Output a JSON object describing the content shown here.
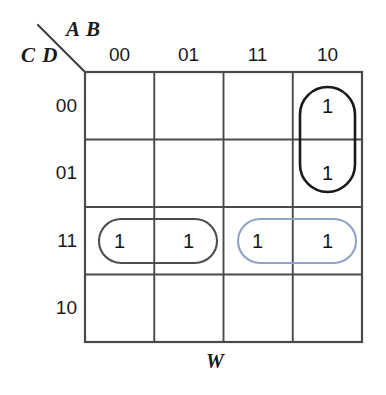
{
  "diagram": {
    "type": "karnaugh-map",
    "title_top": "A B",
    "title_left": "C D",
    "bottom_variable": "W",
    "column_headers": [
      "00",
      "01",
      "11",
      "10"
    ],
    "row_headers": [
      "00",
      "01",
      "11",
      "10"
    ],
    "cells": [
      [
        {
          "value": ""
        },
        {
          "value": ""
        },
        {
          "value": ""
        },
        {
          "value": "1"
        }
      ],
      [
        {
          "value": ""
        },
        {
          "value": ""
        },
        {
          "value": ""
        },
        {
          "value": "1"
        }
      ],
      [
        {
          "value": "1"
        },
        {
          "value": "1"
        },
        {
          "value": "1"
        },
        {
          "value": "1"
        }
      ],
      [
        {
          "value": ""
        },
        {
          "value": ""
        },
        {
          "value": ""
        },
        {
          "value": ""
        }
      ]
    ],
    "groups": [
      {
        "name": "group-vertical-black",
        "color": "#1a1a1a",
        "orientation": "vertical",
        "columns": [
          "10"
        ],
        "rows": [
          "00",
          "01"
        ]
      },
      {
        "name": "group-horizontal-gray",
        "color": "#4d4d4d",
        "orientation": "horizontal",
        "columns": [
          "00",
          "01"
        ],
        "rows": [
          "11"
        ]
      },
      {
        "name": "group-horizontal-blue",
        "color": "#8fa3c9",
        "orientation": "horizontal",
        "columns": [
          "11",
          "10"
        ],
        "rows": [
          "11"
        ]
      }
    ],
    "colors": {
      "grid_line": "#4a4a4a",
      "text": "#1a1a1a",
      "background": "#ffffff",
      "group_black": "#1a1a1a",
      "group_gray": "#4d4d4d",
      "group_blue": "#8fa3c9"
    }
  }
}
